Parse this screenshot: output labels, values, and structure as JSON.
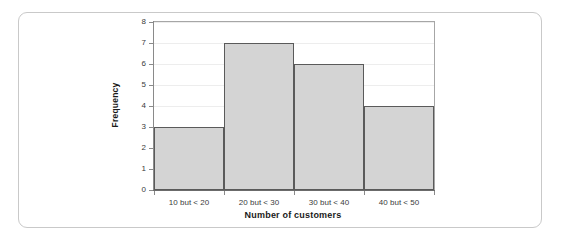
{
  "chart_data": {
    "type": "bar",
    "title": "",
    "subtitle": "",
    "categories": [
      "10 but < 20",
      "20 but < 30",
      "30 but < 40",
      "40 but < 50"
    ],
    "values": [
      3,
      7,
      6,
      4
    ],
    "xlabel": "Number of customers",
    "ylabel": "Frequency",
    "ylim": [
      0,
      8
    ],
    "ytick_labels": [
      "0",
      "1",
      "2",
      "3",
      "4",
      "5",
      "6",
      "7",
      "8"
    ],
    "ytick_values": [
      0,
      1,
      2,
      3,
      4,
      5,
      6,
      7,
      8
    ],
    "grid": true,
    "grid_axis": "y",
    "legend": false,
    "legend_position": "none",
    "bar_gap": 0,
    "colors": {
      "bar_fill": "#d4d4d4",
      "bar_edge": "#5a5a5a",
      "gridline": "#ededed",
      "axis": "#8a8a8a",
      "plot_border": "#a6a6a6",
      "text": "#3b3b3b",
      "title_text": "#1a1a1a",
      "card_border": "#c9c9c9",
      "background": "#ffffff"
    }
  }
}
